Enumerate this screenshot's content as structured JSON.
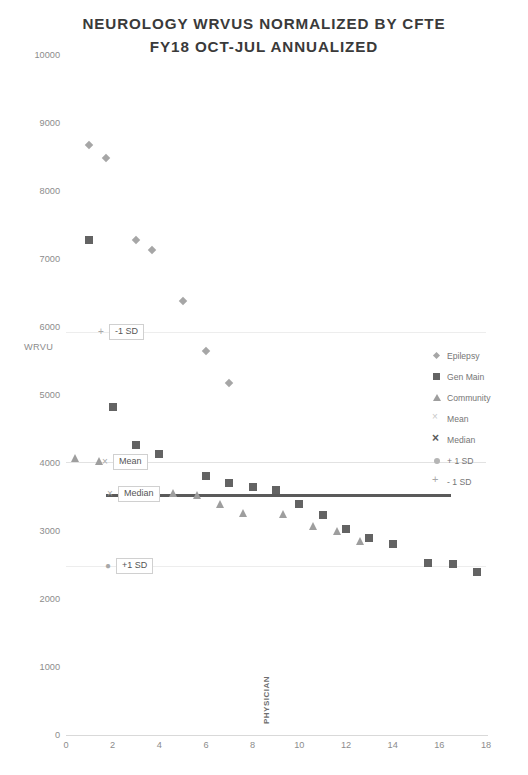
{
  "chart_data": {
    "type": "scatter",
    "title": "NEUROLOGY WRVUS NORMALIZED BY CFTE",
    "subtitle": "FY18 OCT-JUL ANNUALIZED",
    "xlabel": "PHYSICIAN",
    "ylabel": "WRVU",
    "xlim": [
      0,
      18
    ],
    "ylim": [
      0,
      10000
    ],
    "xticks": [
      0,
      2,
      4,
      6,
      8,
      10,
      12,
      14,
      16,
      18
    ],
    "yticks": [
      0,
      1000,
      2000,
      3000,
      4000,
      5000,
      6000,
      7000,
      8000,
      9000,
      10000
    ],
    "grid": false,
    "legend_position": "right",
    "series": [
      {
        "name": "Epilepsy",
        "marker": "diamond",
        "color": "#a6a6a6",
        "points": [
          {
            "x": 1.0,
            "y": 8680
          },
          {
            "x": 1.7,
            "y": 8480
          },
          {
            "x": 3.0,
            "y": 7280
          },
          {
            "x": 3.7,
            "y": 7130
          },
          {
            "x": 5.0,
            "y": 6380
          },
          {
            "x": 6.0,
            "y": 5650
          },
          {
            "x": 7.0,
            "y": 5180
          }
        ]
      },
      {
        "name": "Gen Main",
        "marker": "square",
        "color": "#636363",
        "points": [
          {
            "x": 1.0,
            "y": 7280
          },
          {
            "x": 2.0,
            "y": 4830
          },
          {
            "x": 3.0,
            "y": 4270
          },
          {
            "x": 4.0,
            "y": 4130
          },
          {
            "x": 6.0,
            "y": 3810
          },
          {
            "x": 7.0,
            "y": 3700
          },
          {
            "x": 8.0,
            "y": 3640
          },
          {
            "x": 9.0,
            "y": 3610
          },
          {
            "x": 10.0,
            "y": 3400
          },
          {
            "x": 11.0,
            "y": 3230
          },
          {
            "x": 12.0,
            "y": 3030
          },
          {
            "x": 13.0,
            "y": 2900
          },
          {
            "x": 14.0,
            "y": 2810
          },
          {
            "x": 15.5,
            "y": 2530
          },
          {
            "x": 16.6,
            "y": 2520
          },
          {
            "x": 17.6,
            "y": 2390
          }
        ]
      },
      {
        "name": "Community",
        "marker": "triangle",
        "color": "#9e9e9e",
        "points": [
          {
            "x": 0.4,
            "y": 4070
          },
          {
            "x": 1.4,
            "y": 4030
          },
          {
            "x": 2.6,
            "y": 4000
          },
          {
            "x": 4.6,
            "y": 3560
          },
          {
            "x": 5.6,
            "y": 3530
          },
          {
            "x": 6.6,
            "y": 3400
          },
          {
            "x": 7.6,
            "y": 3270
          },
          {
            "x": 9.3,
            "y": 3250
          },
          {
            "x": 10.6,
            "y": 3080
          },
          {
            "x": 11.6,
            "y": 3000
          },
          {
            "x": 12.6,
            "y": 2850
          }
        ]
      }
    ],
    "reference_lines": [
      {
        "name": "Mean",
        "value": 4020,
        "marker": "x",
        "color": "#c9c9c9"
      },
      {
        "name": "Median",
        "value": 3540,
        "marker": "x-bold",
        "color": "#5a5a5a"
      },
      {
        "name": "+1 SD",
        "value": 2480,
        "marker": "circle",
        "color": "#b5b5b5"
      },
      {
        "name": "-1 SD",
        "value": 5930,
        "marker": "plus",
        "color": "#a8a8a8"
      }
    ],
    "legend_entries": [
      {
        "label": "Epilepsy",
        "marker": "diamond"
      },
      {
        "label": "Gen Main",
        "marker": "square"
      },
      {
        "label": "Community",
        "marker": "triangle"
      },
      {
        "label": "Mean",
        "marker": "x"
      },
      {
        "label": "Median",
        "marker": "x-bold"
      },
      {
        "label": "+ 1 SD",
        "marker": "circle"
      },
      {
        "label": "- 1 SD",
        "marker": "plus"
      }
    ],
    "callouts": [
      {
        "label": "-1 SD",
        "marker": "+",
        "x_px": 96,
        "value": 5930
      },
      {
        "label": "Mean",
        "marker": "×",
        "x_px": 100,
        "value": 4020
      },
      {
        "label": "Median",
        "marker": "×",
        "x_px": 105,
        "value": 3540
      },
      {
        "label": "+1 SD",
        "marker": "●",
        "x_px": 103,
        "value": 2480
      }
    ]
  }
}
